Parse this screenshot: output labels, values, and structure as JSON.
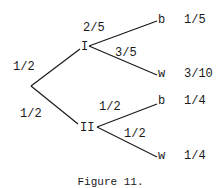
{
  "diagram": {
    "type": "probability-tree",
    "caption": "Figure 11.",
    "root": {
      "branches": [
        {
          "probability": "1/2",
          "node": "I",
          "branches": [
            {
              "probability": "2/5",
              "outcome": "b",
              "joint_probability": "1/5"
            },
            {
              "probability": "3/5",
              "outcome": "w",
              "joint_probability": "3/10"
            }
          ]
        },
        {
          "probability": "1/2",
          "node": "II",
          "branches": [
            {
              "probability": "1/2",
              "outcome": "b",
              "joint_probability": "1/4"
            },
            {
              "probability": "1/2",
              "outcome": "w",
              "joint_probability": "1/4"
            }
          ]
        }
      ]
    }
  }
}
